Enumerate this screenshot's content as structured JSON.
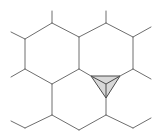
{
  "diagram": {
    "type": "hexagonal-lattice-with-triangle-defect",
    "colors": {
      "background": "#ffffff",
      "edge": "#6e6e6e",
      "triangle_fill": "#d8d8d8",
      "triangle_edge": "#4a4a4a"
    },
    "hexagons": [
      {
        "name": "upper-left-hexagon",
        "points": [
          [
            52,
            23
          ],
          [
            79,
            37
          ],
          [
            79,
            69
          ],
          [
            52,
            84
          ],
          [
            25,
            69
          ],
          [
            25,
            39
          ]
        ]
      },
      {
        "name": "upper-right-hexagon",
        "points": [
          [
            106,
            23
          ],
          [
            133,
            37
          ],
          [
            133,
            69
          ],
          [
            120,
            76
          ],
          [
            91,
            76
          ],
          [
            79,
            69
          ],
          [
            79,
            37
          ]
        ]
      },
      {
        "name": "lower-hexagon",
        "points": [
          [
            52,
            84
          ],
          [
            79,
            69
          ],
          [
            91,
            76
          ],
          [
            106,
            98
          ],
          [
            106,
            115
          ],
          [
            79,
            130
          ],
          [
            52,
            115
          ]
        ]
      }
    ],
    "stubs": [
      [
        [
          52,
          23
        ],
        [
          52,
          11
        ]
      ],
      [
        [
          25,
          39
        ],
        [
          11,
          32
        ]
      ],
      [
        [
          25,
          69
        ],
        [
          11,
          77
        ]
      ],
      [
        [
          106,
          23
        ],
        [
          106,
          11
        ]
      ],
      [
        [
          133,
          37
        ],
        [
          151,
          27
        ]
      ],
      [
        [
          133,
          69
        ],
        [
          151,
          79
        ]
      ],
      [
        [
          52,
          115
        ],
        [
          25,
          128
        ]
      ],
      [
        [
          25,
          128
        ],
        [
          11,
          121
        ]
      ],
      [
        [
          106,
          115
        ],
        [
          133,
          128
        ]
      ],
      [
        [
          133,
          128
        ],
        [
          151,
          118
        ]
      ]
    ],
    "triangle": {
      "vertices": [
        [
          91,
          76
        ],
        [
          120,
          76
        ],
        [
          106,
          98
        ]
      ],
      "center": [
        106,
        84
      ]
    }
  }
}
